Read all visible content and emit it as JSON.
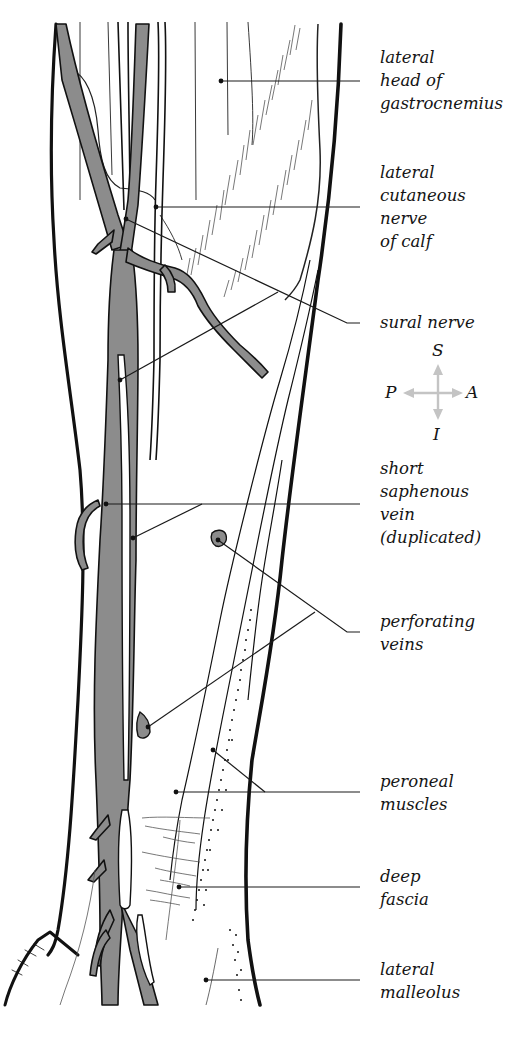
{
  "figure": {
    "colors": {
      "vein_fill": "#8c8c8c",
      "outline": "#111111",
      "leader": "#1a1a1a",
      "orientation_arrow": "#c4c4c4",
      "background": "#ffffff"
    }
  },
  "labels": [
    {
      "id": "lateral-head-gastrocnemius",
      "lines": [
        "lateral",
        "head of",
        "gastrocnemius"
      ]
    },
    {
      "id": "lateral-cutaneous-nerve",
      "lines": [
        "lateral",
        "cutaneous",
        "nerve",
        "of calf"
      ]
    },
    {
      "id": "sural-nerve",
      "lines": [
        "sural nerve"
      ]
    },
    {
      "id": "short-saphenous-vein",
      "lines": [
        "short",
        "saphenous",
        "vein",
        "(duplicated)"
      ]
    },
    {
      "id": "perforating-veins",
      "lines": [
        "perforating",
        "veins"
      ]
    },
    {
      "id": "peroneal-muscles",
      "lines": [
        "peroneal",
        "muscles"
      ]
    },
    {
      "id": "deep-fascia",
      "lines": [
        "deep",
        "fascia"
      ]
    },
    {
      "id": "lateral-malleolus",
      "lines": [
        "lateral",
        "malleolus"
      ]
    }
  ],
  "orientation": {
    "superior": "S",
    "inferior": "I",
    "posterior": "P",
    "anterior": "A"
  }
}
